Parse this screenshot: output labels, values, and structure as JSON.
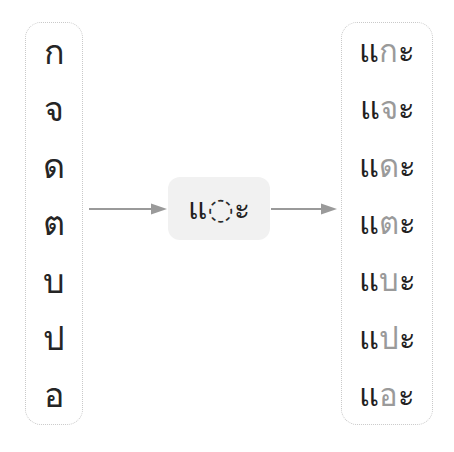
{
  "diagram": {
    "type": "thai-vowel-formation",
    "background_color": "#ffffff",
    "arrow_color": "#9a9a9a",
    "chip_background": "#f1f1f1",
    "source_text_color": "#252525",
    "inserted_consonant_color": "#9a9a9a",
    "vowel_mark_color": "#1f1f1f"
  },
  "source_column": {
    "name": "consonants",
    "items": [
      {
        "glyph": "ก",
        "name": "ko-kai"
      },
      {
        "glyph": "จ",
        "name": "cho-chan"
      },
      {
        "glyph": "ด",
        "name": "do-dek"
      },
      {
        "glyph": "ต",
        "name": "to-tao"
      },
      {
        "glyph": "บ",
        "name": "bo-baimai"
      },
      {
        "glyph": "ป",
        "name": "po-pla"
      },
      {
        "glyph": "อ",
        "name": "o-ang"
      }
    ]
  },
  "pattern": {
    "lead_vowel": "แ",
    "slot_placeholder": "◌",
    "trailing_vowel": "ะ",
    "full": "แ◌ะ"
  },
  "arrows": {
    "left": {
      "name": "arrow-right-glyph",
      "direction": "right"
    },
    "right": {
      "name": "arrow-right-glyph",
      "direction": "right"
    }
  },
  "result_column": {
    "name": "syllables",
    "items": [
      {
        "lead": "แ",
        "consonant": "ก",
        "trail": "ะ",
        "full": "แกะ"
      },
      {
        "lead": "แ",
        "consonant": "จ",
        "trail": "ะ",
        "full": "แจะ"
      },
      {
        "lead": "แ",
        "consonant": "ด",
        "trail": "ะ",
        "full": "แดะ"
      },
      {
        "lead": "แ",
        "consonant": "ต",
        "trail": "ะ",
        "full": "แตะ"
      },
      {
        "lead": "แ",
        "consonant": "บ",
        "trail": "ะ",
        "full": "แบะ"
      },
      {
        "lead": "แ",
        "consonant": "ป",
        "trail": "ะ",
        "full": "แปะ"
      },
      {
        "lead": "แ",
        "consonant": "อ",
        "trail": "ะ",
        "full": "แอะ"
      }
    ]
  }
}
